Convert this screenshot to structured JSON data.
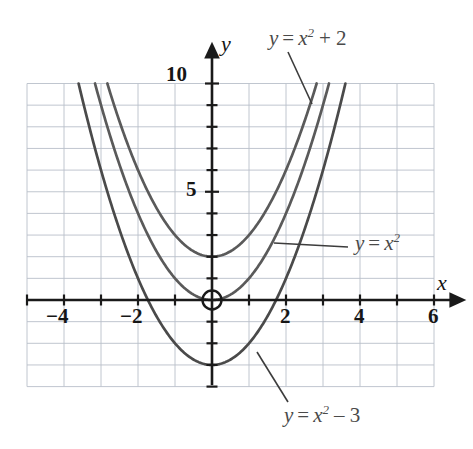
{
  "chart_data": {
    "type": "line",
    "title": "",
    "xlabel": "x",
    "ylabel": "y",
    "xlim": [
      -5,
      6
    ],
    "ylim": [
      -4,
      10
    ],
    "grid": true,
    "grid_step_x": 1,
    "grid_step_y": 1,
    "x_ticks": [
      -4,
      -2,
      2,
      4,
      6
    ],
    "x_tick_labels": [
      "−4",
      "−2",
      "2",
      "4",
      "6"
    ],
    "y_ticks": [
      5,
      10
    ],
    "y_tick_labels": [
      "5",
      "10"
    ],
    "origin_marker": "circle",
    "legend_position": "inline-annotations",
    "series": [
      {
        "name": "y = x² + 2",
        "equation_parts": {
          "lhs": "y",
          "eq": "=",
          "base": "x",
          "exponent": "2",
          "operator": "+",
          "constant": "2"
        },
        "vertex": [
          0,
          2
        ],
        "color": "#5a5a5a",
        "x": [
          -2.83,
          -2.5,
          -2,
          -1.5,
          -1,
          -0.5,
          0,
          0.5,
          1,
          1.5,
          2,
          2.5,
          2.83
        ],
        "y": [
          10,
          8.25,
          6,
          4.25,
          3,
          2.25,
          2,
          2.25,
          3,
          4.25,
          6,
          8.25,
          10
        ]
      },
      {
        "name": "y = x²",
        "equation_parts": {
          "lhs": "y",
          "eq": "=",
          "base": "x",
          "exponent": "2",
          "operator": "",
          "constant": ""
        },
        "vertex": [
          0,
          0
        ],
        "color": "#5a5a5a",
        "x": [
          -3.16,
          -3,
          -2.5,
          -2,
          -1.5,
          -1,
          -0.5,
          0,
          0.5,
          1,
          1.5,
          2,
          2.5,
          3,
          3.16
        ],
        "y": [
          10,
          9,
          6.25,
          4,
          2.25,
          1,
          0.25,
          0,
          0.25,
          1,
          2.25,
          4,
          6.25,
          9,
          10
        ]
      },
      {
        "name": "y = x² − 3",
        "equation_parts": {
          "lhs": "y",
          "eq": "=",
          "base": "x",
          "exponent": "2",
          "operator": "−",
          "constant": "3"
        },
        "vertex": [
          0,
          -3
        ],
        "color": "#4a4a4a",
        "x": [
          -3.61,
          -3.5,
          -3,
          -2.5,
          -2,
          -1.5,
          -1,
          -0.5,
          0,
          0.5,
          1,
          1.5,
          2,
          2.5,
          3,
          3.5,
          3.61
        ],
        "y": [
          10,
          9.25,
          6,
          3.25,
          1,
          -0.75,
          -2,
          -2.75,
          -3,
          -2.75,
          -2,
          -0.75,
          1,
          3.25,
          6,
          9.25,
          10
        ]
      }
    ],
    "annotations": [
      {
        "text": "y = x² + 2",
        "target_series": "y = x² + 2",
        "position": "top-right"
      },
      {
        "text": "y = x²",
        "target_series": "y = x²",
        "position": "middle-right"
      },
      {
        "text": "y = x² − 3",
        "target_series": "y = x² − 3",
        "position": "bottom-center"
      }
    ]
  },
  "axes": {
    "x_axis_label": "x",
    "y_axis_label": "y"
  },
  "ticks": {
    "x": {
      "m4": "−4",
      "m2": "−2",
      "p2": "2",
      "p4": "4",
      "p6": "6"
    },
    "y": {
      "p5": "5",
      "p10": "10"
    }
  },
  "labels": {
    "curve_top": {
      "y": "y",
      "eq": "=",
      "x": "x",
      "exp": "2",
      "tail": "+ 2"
    },
    "curve_mid": {
      "y": "y",
      "eq": "=",
      "x": "x",
      "exp": "2"
    },
    "curve_bottom": {
      "y": "y",
      "eq": "=",
      "x": "x",
      "exp": "2",
      "tail": "– 3"
    }
  },
  "colors": {
    "curve": "#555555",
    "axis": "#1a1a1a",
    "grid": "#b9bfc9",
    "text": "#161616",
    "label_text": "#4a4a4a",
    "background": "#ffffff"
  }
}
